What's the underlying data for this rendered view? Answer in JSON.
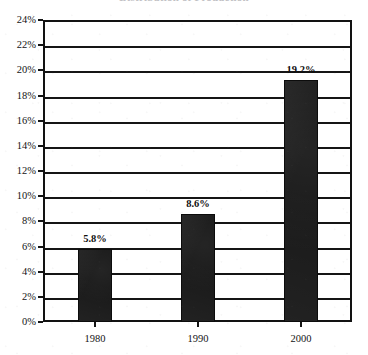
{
  "chart_data": {
    "type": "bar",
    "title": "Distribution of Production",
    "categories": [
      "1980",
      "1990",
      "2000"
    ],
    "values": [
      5.8,
      19.2,
      8.6
    ],
    "value_labels": [
      "5.8%",
      "8.6%",
      "19.2%"
    ],
    "ordered_values": [
      5.8,
      8.6,
      19.2
    ],
    "xlabel": "",
    "ylabel": "",
    "ylim": [
      0,
      24
    ],
    "ytick_step": 2,
    "ytick_labels": [
      "0%",
      "2%",
      "4%",
      "6%",
      "8%",
      "10%",
      "12%",
      "14%",
      "16%",
      "18%",
      "20%",
      "22%",
      "24%"
    ],
    "ytick_values": [
      0,
      2,
      4,
      6,
      8,
      10,
      12,
      14,
      16,
      18,
      20,
      22,
      24
    ],
    "grid": true,
    "grid_axis": "y",
    "legend": false,
    "legend_position": "none",
    "series": [
      {
        "name": "Percent",
        "values": [
          5.8,
          8.6,
          19.2
        ]
      }
    ],
    "bar_color": "#191919",
    "grid_color": "#151515",
    "axis_color": "#121212",
    "background_color": "#ffffff",
    "bars": [
      {
        "category": "1980",
        "value": 5.8,
        "label": "5.8%"
      },
      {
        "category": "1990",
        "value": 8.6,
        "label": "8.6%"
      },
      {
        "category": "2000",
        "value": 19.2,
        "label": "19.2%"
      }
    ]
  }
}
